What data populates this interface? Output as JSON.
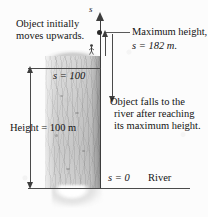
{
  "figure": {
    "type": "physics-kinematics-diagram",
    "axis_label": "s",
    "annotations": {
      "initial_motion": {
        "line1": "Object initially",
        "line2": "moves upwards."
      },
      "max_height": {
        "line1": "Maximum height,",
        "line2": "s = 182 m."
      },
      "falling": {
        "line1": "Object falls to the",
        "line2": "river after reaching",
        "line3": "its maximum height."
      },
      "cliff_top_value": "s = 100",
      "cliff_height": "Height = 100 m",
      "datum_value": "s = 0",
      "datum_name": "River"
    },
    "values": {
      "maximum_height_m": 182,
      "cliff_height_m": 100,
      "datum_m": 0,
      "unit": "m"
    },
    "colors": {
      "ink": "#141414",
      "line": "#3d3d3d",
      "rock": "#d6d6d6",
      "paper": "#fcfcfc"
    }
  }
}
